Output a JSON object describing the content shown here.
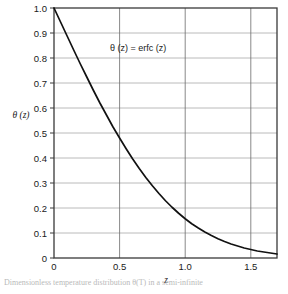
{
  "figure": {
    "background_color": "#ffffff",
    "axis_color": "#3a3a3a",
    "grid_color": "#a8a8a8",
    "curve_color": "#111111"
  },
  "chart_data": {
    "type": "line",
    "title": "",
    "annotation": {
      "theta": "θ",
      "text_parts": [
        "θ",
        " (",
        "z",
        ") = erfc (",
        "z",
        ")"
      ],
      "full_text": "θ (z) = erfc (z)"
    },
    "xlabel": "z",
    "ylabel": "θ (z)",
    "xlim": [
      0,
      1.7
    ],
    "ylim": [
      0,
      1.0
    ],
    "grid": true,
    "legend": null,
    "xticks": [
      0,
      0.5,
      1.0,
      1.5
    ],
    "xtick_labels": [
      "0",
      "0.5",
      "1.0",
      "1.5"
    ],
    "yticks": [
      0,
      0.1,
      0.2,
      0.3,
      0.4,
      0.5,
      0.6,
      0.7,
      0.8,
      0.9,
      1.0
    ],
    "ytick_labels": [
      "0",
      "0.1",
      "0.2",
      "0.3",
      "0.4",
      "0.5",
      "0.6",
      "0.7",
      "0.8",
      "0.9",
      "1.0"
    ],
    "series": [
      {
        "name": "erfc(z)",
        "x": [
          0.0,
          0.05,
          0.1,
          0.15,
          0.2,
          0.25,
          0.3,
          0.35,
          0.4,
          0.45,
          0.5,
          0.55,
          0.6,
          0.65,
          0.7,
          0.75,
          0.8,
          0.85,
          0.9,
          0.95,
          1.0,
          1.05,
          1.1,
          1.15,
          1.2,
          1.25,
          1.3,
          1.35,
          1.4,
          1.45,
          1.5,
          1.55,
          1.6,
          1.65,
          1.7
        ],
        "values": [
          1.0,
          0.944,
          0.888,
          0.832,
          0.777,
          0.724,
          0.671,
          0.62,
          0.572,
          0.524,
          0.48,
          0.437,
          0.396,
          0.358,
          0.322,
          0.289,
          0.258,
          0.229,
          0.203,
          0.179,
          0.157,
          0.137,
          0.12,
          0.104,
          0.09,
          0.077,
          0.066,
          0.056,
          0.048,
          0.04,
          0.034,
          0.028,
          0.024,
          0.02,
          0.016
        ]
      }
    ]
  },
  "caption": {
    "text": "Dimensionless temperature distribution θ(T) in a semi-infinite"
  }
}
